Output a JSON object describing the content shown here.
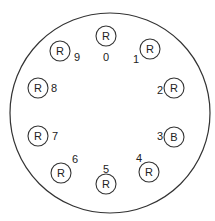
{
  "diagram": {
    "title": "",
    "positions": [
      {
        "index": "0",
        "label": "R"
      },
      {
        "index": "1",
        "label": "R"
      },
      {
        "index": "2",
        "label": "R"
      },
      {
        "index": "3",
        "label": "B"
      },
      {
        "index": "4",
        "label": "R"
      },
      {
        "index": "5",
        "label": "R"
      },
      {
        "index": "6",
        "label": "R"
      },
      {
        "index": "7",
        "label": "R"
      },
      {
        "index": "8",
        "label": "R"
      },
      {
        "index": "9",
        "label": "R"
      }
    ]
  }
}
